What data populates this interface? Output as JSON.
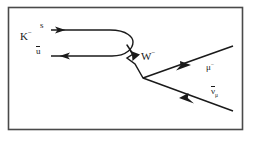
{
  "figure": {
    "kind": "feynman-diagram",
    "title_text": "",
    "background_color": "#ffffff",
    "border_color": "#4a4a4a",
    "line_color": "#1a1a1a",
    "frame": {
      "x": 8,
      "y": 7,
      "width": 235,
      "height": 123
    }
  },
  "labels": {
    "kaon": "K",
    "kaon_charge": "−",
    "strange_quark": "s",
    "up_antiquark": "u",
    "w_boson": "W",
    "w_charge": "−",
    "muon": "μ",
    "muon_charge": "−",
    "antineutrino": "ν",
    "antineutrino_sub": "μ"
  },
  "particles": [
    {
      "name": "strange-quark-line",
      "label": "s",
      "arrow_direction": "right",
      "description": "upper quark line flowing right into the loop"
    },
    {
      "name": "up-antiquark-line",
      "label": "u-bar",
      "arrow_direction": "left",
      "description": "lower antiquark line flowing left out of the loop"
    },
    {
      "name": "w-boson-line",
      "label": "W-minus",
      "arrow_direction": "down-right",
      "description": "zigzag virtual W boson propagator"
    },
    {
      "name": "muon-line",
      "label": "mu-minus",
      "arrow_direction": "up-right",
      "description": "outgoing muon"
    },
    {
      "name": "antineutrino-line",
      "label": "nu-bar-mu",
      "arrow_direction": "down-left",
      "description": "outgoing muon antineutrino, arrow toward vertex"
    }
  ]
}
